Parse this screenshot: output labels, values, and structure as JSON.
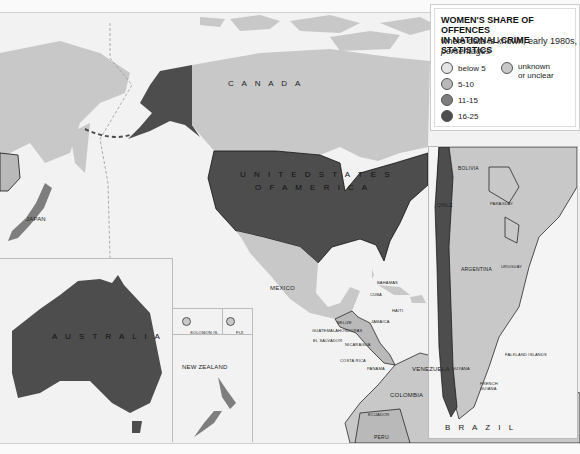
{
  "legend": {
    "title_line1": "WOMEN'S SHARE OF OFFENCES",
    "title_line2": "IN NATIONAL CRIME STATISTICS",
    "subtitle": "where data is known, early 1980s,",
    "subtitle_italic": "percentages",
    "items": [
      {
        "label": "below 5",
        "color": "#e4e4e4"
      },
      {
        "label": "5-10",
        "color": "#b9b9b9"
      },
      {
        "label": "11-15",
        "color": "#7e7e7e"
      },
      {
        "label": "16-25",
        "color": "#4d4d4d"
      }
    ],
    "unknown": {
      "label_line1": "unknown",
      "label_line2": "or unclear",
      "color": "#c8c8c8"
    }
  },
  "countries": {
    "canada": "C A N A D A",
    "usa_line1": "U N I T E D  S T A T E S",
    "usa_line2": "O F  A M E R I C A",
    "mexico": "MEXICO",
    "japan": "JAPAN",
    "australia": "A U S T R A L I A",
    "new_zealand": "NEW ZEALAND",
    "solomon": "SOLOMON IS.",
    "fiji": "FIJI",
    "bahamas": "BAHAMAS",
    "cuba": "CUBA",
    "haiti": "HAITI",
    "jamaica": "JAMAICA",
    "belize": "BELIZE",
    "guatemala": "GUATEMALA",
    "honduras": "HONDURAS",
    "el_salvador": "EL SALVADOR",
    "nicaragua": "NICARAGUA",
    "costa_rica": "COSTA RICA",
    "panama": "PANAMA",
    "venezuela": "VENEZUELA",
    "guyana": "GUYANA",
    "french_guiana": "FRENCH GUIANA",
    "colombia": "COLOMBIA",
    "ecuador": "ECUADOR",
    "peru": "PERU",
    "brazil": "B R A Z I L",
    "bolivia": "BOLIVIA",
    "paraguay": "PARAGUAY",
    "chile": "CHILE",
    "argentina": "ARGENTINA",
    "uruguay": "URUGUAY",
    "falklands": "FALKLAND ISLANDS"
  },
  "colors": {
    "sea": "#f2f2f2",
    "unknown": "#c8c8c8",
    "below5": "#e4e4e4",
    "c5_10": "#b9b9b9",
    "c11_15": "#7e7e7e",
    "c16_25": "#4d4d4d"
  }
}
